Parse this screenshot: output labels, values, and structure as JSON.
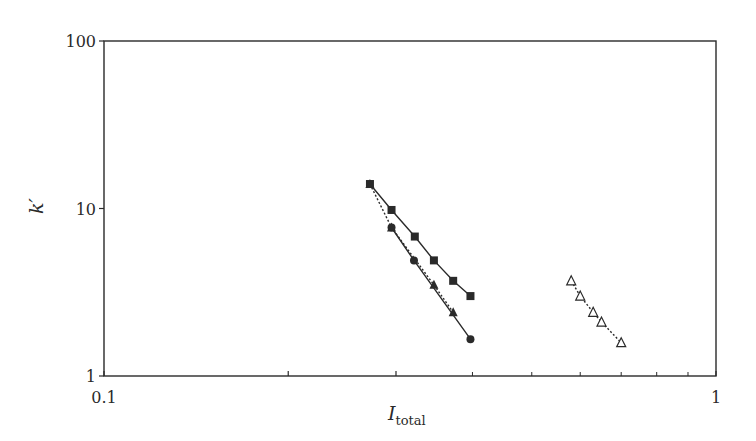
{
  "chart_data": {
    "type": "scatter",
    "title": "",
    "xlabel": "I_total",
    "xlabel_main": "I",
    "xlabel_sub": "total",
    "ylabel": "k′",
    "xscale": "log",
    "yscale": "log",
    "xlim": [
      0.1,
      1
    ],
    "ylim": [
      1,
      100
    ],
    "x_ticks": [
      0.1,
      0.2,
      0.3,
      1
    ],
    "x_tick_labels": [
      "0.1",
      "",
      "",
      "1"
    ],
    "y_tick_labels": [
      "1",
      "10",
      "100"
    ],
    "grid": false,
    "legend": null,
    "series": [
      {
        "name": "filled squares",
        "marker": "square-filled",
        "line": "solid",
        "x": [
          0.272,
          0.295,
          0.322,
          0.346,
          0.372,
          0.397
        ],
        "y": [
          14.0,
          9.8,
          6.8,
          4.9,
          3.7,
          3.0
        ]
      },
      {
        "name": "filled triangles",
        "marker": "triangle-filled",
        "line": "dotted",
        "x": [
          0.272,
          0.295,
          0.346,
          0.372
        ],
        "y": [
          14.0,
          7.7,
          3.5,
          2.4
        ]
      },
      {
        "name": "filled circles",
        "marker": "circle-filled",
        "line": "solid",
        "x": [
          0.295,
          0.321,
          0.397
        ],
        "y": [
          7.7,
          4.9,
          1.66
        ]
      },
      {
        "name": "open triangles",
        "marker": "triangle-open",
        "line": "dotted",
        "x": [
          0.58,
          0.6,
          0.63,
          0.65,
          0.7
        ],
        "y": [
          3.7,
          3.0,
          2.4,
          2.1,
          1.58
        ]
      }
    ]
  }
}
